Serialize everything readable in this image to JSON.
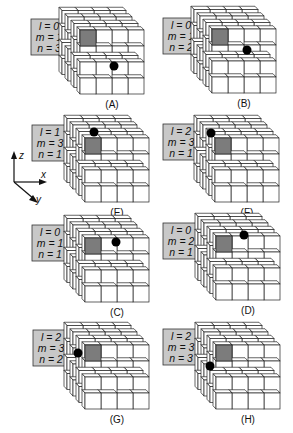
{
  "colors": {
    "label_box_fill": "#c8c8c8",
    "highlight_cell": "#7c7c7c",
    "dot": "#000000",
    "line": "#222222"
  },
  "axes": {
    "z_label": "z",
    "x_label": "x",
    "y_label": "y"
  },
  "panels": [
    {
      "id": "A",
      "caption": "(A)",
      "l": "l = 0",
      "m": "m = 1",
      "n": "n = 3",
      "box": [
        31,
        19
      ],
      "cube": [
        80,
        30
      ],
      "dot": [
        34,
        36
      ]
    },
    {
      "id": "B",
      "caption": "(B)",
      "l": "l = 0",
      "m": "m = 1",
      "n": "n = 2",
      "box": [
        163,
        18
      ],
      "cube": [
        212,
        29
      ],
      "dot": [
        35,
        21
      ]
    },
    {
      "id": "E",
      "caption": "(E)",
      "l": "l = 1",
      "m": "m = 3",
      "n": "n = 1",
      "box": [
        32,
        125
      ],
      "cube": [
        85,
        138
      ],
      "dot": [
        9,
        -6
      ]
    },
    {
      "id": "F",
      "caption": "(F)",
      "l": "l = 2",
      "m": "m = 3",
      "n": "n = 1",
      "box": [
        163,
        124
      ],
      "cube": [
        215,
        138
      ],
      "dot": [
        -4,
        -5
      ]
    },
    {
      "id": "C",
      "caption": "(C)",
      "l": "l = 0",
      "m": "m = 1",
      "n": "n = 1",
      "box": [
        32,
        225
      ],
      "cube": [
        85,
        238
      ],
      "dot": [
        31,
        4
      ]
    },
    {
      "id": "D",
      "caption": "(D)",
      "l": "l = 0",
      "m": "m = 2",
      "n": "n = 1",
      "box": [
        163,
        223
      ],
      "cube": [
        216,
        236
      ],
      "dot": [
        28,
        -1
      ]
    },
    {
      "id": "G",
      "caption": "(G)",
      "l": "l = 2",
      "m": "m = 3",
      "n": "n = 2",
      "box": [
        33,
        330
      ],
      "cube": [
        85,
        345
      ],
      "dot": [
        -7,
        8
      ]
    },
    {
      "id": "H",
      "caption": "(H)",
      "l": "l = 2",
      "m": "m = 3",
      "n": "n = 3",
      "box": [
        163,
        329
      ],
      "cube": [
        216,
        345
      ],
      "dot": [
        -6,
        21
      ]
    }
  ]
}
